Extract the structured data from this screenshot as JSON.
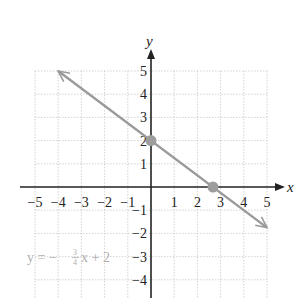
{
  "chart_data": {
    "type": "line",
    "title": "",
    "xlabel": "x",
    "ylabel": "y",
    "xlim": [
      -5,
      5
    ],
    "ylim": [
      -4.8,
      5
    ],
    "grid": true,
    "x_ticks": [
      "−5",
      "−4",
      "−3",
      "−2",
      "−1",
      "1",
      "2",
      "3",
      "4",
      "5"
    ],
    "y_ticks": [
      "5",
      "4",
      "3",
      "2",
      "1",
      "−1",
      "−2",
      "−3",
      "−4"
    ],
    "series": [
      {
        "name": "y = -3/4 x + 2",
        "slope": -0.75,
        "intercept": 2,
        "x": [
          -4,
          5
        ],
        "y": [
          5,
          -1.75
        ],
        "color": "#9a9a9a"
      }
    ],
    "points": [
      {
        "label": "y-intercept",
        "x": 0,
        "y": 2
      },
      {
        "label": "x-intercept",
        "x": 2.67,
        "y": 0
      }
    ],
    "annotations": [
      {
        "text": "y = −(3/4)x + 2",
        "x": -4.2,
        "y": -2.8
      }
    ]
  },
  "labels": {
    "x_axis": "x",
    "y_axis": "y",
    "equation_prefix": "y = −",
    "equation_num": "3",
    "equation_den": "4",
    "equation_suffix": "x + 2"
  }
}
